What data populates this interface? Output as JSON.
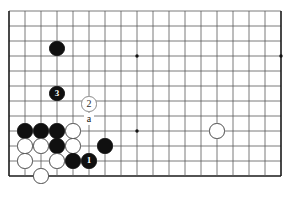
{
  "diagram": {
    "type": "go-board-diagram",
    "board": {
      "cols": 18,
      "rows": 12,
      "origin_x": 9,
      "origin_y": 11,
      "step_x": 16,
      "step_y": 15,
      "line_color": "#595959",
      "edge_color": "#1a1a1a",
      "background": "#ffffff",
      "star_points": [
        {
          "col": 8,
          "row": 3
        },
        {
          "col": 8,
          "row": 8
        },
        {
          "col": 17,
          "row": 3
        }
      ]
    },
    "colors": {
      "black_stone": "#101010",
      "white_stone": "#ffffff",
      "white_stone_border": "#4a4a4a",
      "label_text": "#111111"
    },
    "stones": [
      {
        "id": "black-hoshi-upper",
        "col": 3,
        "row": 2.5,
        "color": "black",
        "label": ""
      },
      {
        "id": "black-move-3",
        "col": 3,
        "row": 5.5,
        "color": "black",
        "label": "3"
      },
      {
        "id": "white-move-2",
        "col": 5,
        "row": 6.2,
        "color": "ghost",
        "label": "2"
      },
      {
        "id": "black-wall-a",
        "col": 1,
        "row": 8,
        "color": "black",
        "label": ""
      },
      {
        "id": "black-wall-b",
        "col": 2,
        "row": 8,
        "color": "black",
        "label": ""
      },
      {
        "id": "black-wall-c",
        "col": 3,
        "row": 8,
        "color": "black",
        "label": ""
      },
      {
        "id": "white-cut-a",
        "col": 4,
        "row": 8,
        "color": "white",
        "label": ""
      },
      {
        "id": "white-mid-a",
        "col": 1,
        "row": 9,
        "color": "white",
        "label": ""
      },
      {
        "id": "white-mid-b",
        "col": 2,
        "row": 9,
        "color": "white",
        "label": ""
      },
      {
        "id": "black-mid-c",
        "col": 3,
        "row": 9,
        "color": "black",
        "label": ""
      },
      {
        "id": "white-mid-d",
        "col": 4,
        "row": 9,
        "color": "white",
        "label": ""
      },
      {
        "id": "black-right-outpost",
        "col": 6,
        "row": 9,
        "color": "black",
        "label": ""
      },
      {
        "id": "white-low-a",
        "col": 1,
        "row": 10,
        "color": "white",
        "label": ""
      },
      {
        "id": "white-low-b",
        "col": 3,
        "row": 10,
        "color": "white",
        "label": ""
      },
      {
        "id": "black-low-c",
        "col": 4,
        "row": 10,
        "color": "black",
        "label": ""
      },
      {
        "id": "black-move-1",
        "col": 5,
        "row": 10,
        "color": "black",
        "label": "1"
      },
      {
        "id": "white-edge-stone",
        "col": 2,
        "row": 11,
        "color": "white",
        "label": ""
      },
      {
        "id": "white-right-side",
        "col": 13,
        "row": 8,
        "color": "white",
        "label": ""
      }
    ],
    "markers": [
      {
        "id": "point-a",
        "col": 5,
        "row": 7.2,
        "text": "a"
      }
    ],
    "stone_radius": 7.6
  }
}
